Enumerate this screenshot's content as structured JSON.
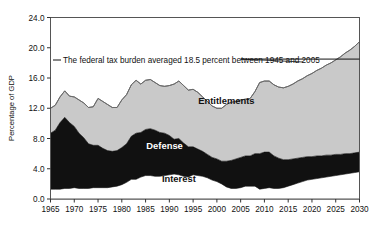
{
  "chart_data": {
    "type": "area",
    "stacked": true,
    "title": "",
    "subtitle": "",
    "xlabel": "",
    "ylabel": "Percentage of GDP",
    "xlim": [
      1965,
      2030
    ],
    "ylim": [
      0.0,
      24.0
    ],
    "grid": false,
    "legend_position": "inline-labels",
    "x_tick_labels": [
      "1965",
      "1970",
      "1975",
      "1980",
      "1985",
      "1990",
      "1995",
      "2000",
      "2005",
      "2010",
      "2015",
      "2020",
      "2025",
      "2030"
    ],
    "y_tick_labels": [
      "0.0",
      "4.0",
      "8.0",
      "12.0",
      "16.0",
      "20.0",
      "24.0"
    ],
    "y_tick_values": [
      0.0,
      4.0,
      8.0,
      12.0,
      16.0,
      20.0,
      24.0
    ],
    "x": [
      1965,
      1966,
      1967,
      1968,
      1969,
      1970,
      1971,
      1972,
      1973,
      1974,
      1975,
      1976,
      1977,
      1978,
      1979,
      1980,
      1981,
      1982,
      1983,
      1984,
      1985,
      1986,
      1987,
      1988,
      1989,
      1990,
      1991,
      1992,
      1993,
      1994,
      1995,
      1996,
      1997,
      1998,
      1999,
      2000,
      2001,
      2002,
      2003,
      2004,
      2005,
      2006,
      2007,
      2008,
      2009,
      2010,
      2011,
      2012,
      2013,
      2014,
      2015,
      2016,
      2017,
      2018,
      2019,
      2020,
      2021,
      2022,
      2023,
      2024,
      2025,
      2026,
      2027,
      2028,
      2029,
      2030
    ],
    "series": [
      {
        "name": "Interest",
        "color": "#ffffff",
        "values": [
          1.3,
          1.3,
          1.3,
          1.4,
          1.4,
          1.5,
          1.4,
          1.4,
          1.4,
          1.5,
          1.5,
          1.5,
          1.5,
          1.6,
          1.7,
          1.9,
          2.2,
          2.6,
          2.6,
          2.9,
          3.1,
          3.1,
          3.0,
          3.0,
          3.1,
          3.2,
          3.3,
          3.2,
          3.0,
          2.9,
          3.2,
          3.1,
          3.0,
          2.8,
          2.5,
          2.3,
          2.0,
          1.6,
          1.4,
          1.4,
          1.5,
          1.7,
          1.7,
          1.7,
          1.3,
          1.4,
          1.5,
          1.4,
          1.4,
          1.5,
          1.7,
          1.9,
          2.1,
          2.3,
          2.5,
          2.6,
          2.7,
          2.8,
          2.9,
          3.0,
          3.1,
          3.2,
          3.3,
          3.4,
          3.5,
          3.6
        ]
      },
      {
        "name": "Defense",
        "color": "#111111",
        "values": [
          7.4,
          7.8,
          8.8,
          9.4,
          8.7,
          8.1,
          7.3,
          6.7,
          5.9,
          5.6,
          5.6,
          5.2,
          4.9,
          4.7,
          4.7,
          4.9,
          5.1,
          5.7,
          6.1,
          5.9,
          6.1,
          6.2,
          6.1,
          5.8,
          5.6,
          5.2,
          4.6,
          4.8,
          4.4,
          4.0,
          3.7,
          3.5,
          3.3,
          3.1,
          3.0,
          3.0,
          3.0,
          3.4,
          3.7,
          3.9,
          4.0,
          4.0,
          4.0,
          4.3,
          4.7,
          4.8,
          4.7,
          4.3,
          4.0,
          3.7,
          3.5,
          3.4,
          3.3,
          3.2,
          3.1,
          3.0,
          3.0,
          2.9,
          2.9,
          2.8,
          2.8,
          2.7,
          2.7,
          2.6,
          2.6,
          2.6
        ]
      },
      {
        "name": "Entitlements",
        "color": "#c9c9c9",
        "values": [
          3.3,
          3.3,
          3.4,
          3.5,
          3.5,
          3.9,
          4.4,
          4.6,
          4.8,
          5.1,
          6.2,
          6.2,
          6.1,
          5.8,
          5.7,
          6.3,
          6.5,
          6.8,
          7.0,
          6.4,
          6.5,
          6.5,
          6.3,
          6.2,
          6.2,
          6.6,
          7.3,
          7.6,
          7.6,
          7.5,
          7.6,
          7.5,
          7.2,
          7.0,
          6.8,
          6.7,
          7.0,
          7.5,
          7.7,
          7.6,
          7.6,
          7.5,
          7.6,
          8.2,
          9.4,
          9.4,
          9.4,
          9.4,
          9.4,
          9.5,
          9.7,
          9.9,
          10.2,
          10.4,
          10.7,
          11.0,
          11.3,
          11.6,
          11.9,
          12.2,
          12.5,
          12.9,
          13.3,
          13.7,
          14.1,
          14.6
        ]
      }
    ],
    "reference_line": {
      "label": "The federal tax burden averaged 18.5 percent between 1945 and 2005",
      "value": 18.5,
      "x_start": 2005,
      "x_end": 2030,
      "color": "#111111"
    },
    "inline_labels": [
      {
        "text": "Entitlements",
        "x": 2002,
        "y": 12.6
      },
      {
        "text": "Defense",
        "x": 1989,
        "y": 6.6
      },
      {
        "text": "Interest",
        "x": 1992,
        "y": 2.2
      }
    ]
  }
}
